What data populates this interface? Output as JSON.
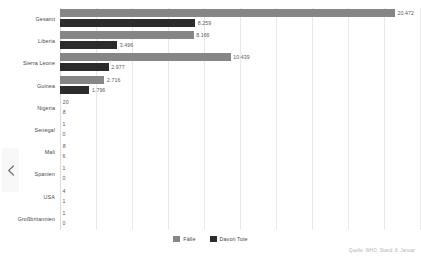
{
  "chart_data": {
    "type": "bar",
    "orientation": "horizontal",
    "title": "",
    "xlabel": "",
    "ylabel": "",
    "xlim": [
      0,
      22000
    ],
    "grid": true,
    "gridline_count": 11,
    "legend_position": "bottom",
    "categories": [
      "Gesamt",
      "Liberia",
      "Sierra Leone",
      "Guinea",
      "Nigeria",
      "Senegal",
      "Mali",
      "Spanien",
      "USA",
      "Großbritannien"
    ],
    "series": [
      {
        "name": "Fälle",
        "color": "#868686",
        "values": [
          20472,
          8166,
          10439,
          2716,
          20,
          1,
          8,
          1,
          4,
          1
        ],
        "labels": [
          "20.472",
          "8.166",
          "10.439",
          "2.716",
          "20",
          "1",
          "8",
          "1",
          "4",
          "1"
        ]
      },
      {
        "name": "Davon Tote",
        "color": "#2c2c2c",
        "values": [
          8259,
          3496,
          2977,
          1796,
          8,
          0,
          6,
          0,
          1,
          0
        ],
        "labels": [
          "8.259",
          "3.496",
          "2.977",
          "1.796",
          "8",
          "0",
          "6",
          "0",
          "1",
          "0"
        ]
      }
    ]
  },
  "legend": {
    "items": [
      {
        "label": "Fälle",
        "color": "#868686"
      },
      {
        "label": "Davon Tote",
        "color": "#2c2c2c"
      }
    ]
  },
  "source": {
    "text": "Quelle: WHO, Stand: 8. Januar"
  },
  "nav": {
    "prev_icon": "chevron-left-icon"
  },
  "colors": {
    "cases": "#868686",
    "deaths": "#2c2c2c",
    "gridline": "#e9e9e9",
    "label_text": "#4a4a4a",
    "value_text": "#5a5a5a",
    "source_text": "#b4b4b4",
    "background": "#ffffff"
  }
}
